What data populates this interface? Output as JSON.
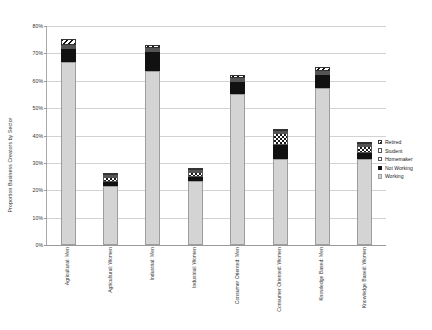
{
  "chart_data": {
    "type": "bar",
    "subtype": "stacked-bar",
    "title": "",
    "xlabel": "",
    "ylabel": "Proportion Business Creators by Sector",
    "ylim": [
      0,
      80
    ],
    "ytick_labels": [
      "0%",
      "10%",
      "20%",
      "30%",
      "40%",
      "50%",
      "60%",
      "70%",
      "80%"
    ],
    "ytick_values": [
      0,
      10,
      20,
      30,
      40,
      50,
      60,
      70,
      80
    ],
    "grid": true,
    "legend_position": "right",
    "categories": [
      "Agricultural: Men",
      "Agricultural: Women",
      "Industrial: Men",
      "Industrial: Women",
      "Consumer Oriented: Men",
      "Consumer Oriented: Women",
      "Knowledge Based: Men",
      "Knowledge Based: Women"
    ],
    "series": [
      {
        "name": "Working",
        "values": [
          67.0,
          21.5,
          63.5,
          23.5,
          55.0,
          31.5,
          57.5,
          31.5
        ]
      },
      {
        "name": "Not Working",
        "values": [
          4.5,
          1.5,
          7.0,
          1.5,
          4.5,
          5.0,
          4.5,
          2.0
        ]
      },
      {
        "name": "Homemaker",
        "values": [
          0.3,
          1.8,
          0.3,
          1.8,
          0.5,
          4.5,
          0.4,
          2.5
        ]
      },
      {
        "name": "Student",
        "values": [
          0.4,
          0.5,
          0.4,
          0.6,
          0.6,
          0.7,
          0.6,
          0.8
        ]
      },
      {
        "name": "Retired",
        "values": [
          2.3,
          0.5,
          1.0,
          0.6,
          1.0,
          0.7,
          1.5,
          0.7
        ]
      }
    ],
    "series_styles": [
      "working",
      "notworking",
      "homemaker",
      "student",
      "retired"
    ]
  },
  "legend": {
    "items": [
      {
        "label": "Retired",
        "style": "retired"
      },
      {
        "label": "Student",
        "style": "student"
      },
      {
        "label": "Homemaker",
        "style": "homemaker"
      },
      {
        "label": "Not Working",
        "style": "notworking"
      },
      {
        "label": "Working",
        "style": "working"
      }
    ]
  },
  "colors": {
    "working": "#d4d4d4",
    "not_working": "#111111",
    "homemaker": "#ffffff",
    "student": "#ffffff",
    "retired": "#ffffff",
    "grid": "#d2d2d2",
    "axis": "#9a9a9a",
    "text": "#333333"
  }
}
